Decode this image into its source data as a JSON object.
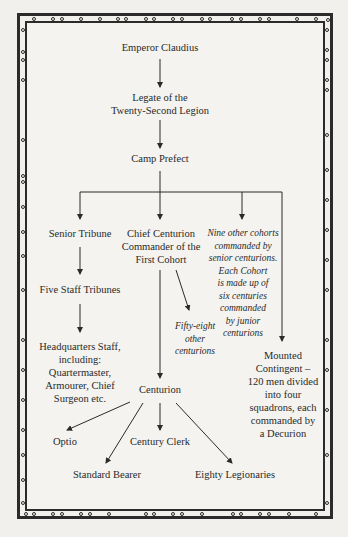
{
  "diagram": {
    "type": "organizational-chart",
    "nodes": {
      "emperor": "Emperor Claudius",
      "legate": "Legate of the\nTwenty-Second Legion",
      "camp_prefect": "Camp Prefect",
      "senior_tribune": "Senior Tribune",
      "chief_centurion": "Chief Centurion\nCommander of the\nFirst Cohort",
      "other_cohorts": "Nine other cohorts\ncommanded by\nsenior centurions.\nEach Cohort\nis made up of\nsix centuries\ncommanded\nby junior\ncenturions",
      "staff_tribunes": "Five Staff Tribunes",
      "fifty_eight": "Fifty-eight\nother\ncenturions",
      "hq_staff": "Headquarters Staff,\nincluding:\nQuartermaster,\nArmourer, Chief\nSurgeon etc.",
      "mounted": "Mounted\nContingent –\n120 men divided\ninto four\nsquadrons, each\ncommanded by\na Decurion",
      "centurion": "Centurion",
      "optio": "Optio",
      "century_clerk": "Century Clerk",
      "standard_bearer": "Standard Bearer",
      "legionaries": "Eighty Legionaries"
    },
    "edges": [
      [
        "emperor",
        "legate"
      ],
      [
        "legate",
        "camp_prefect"
      ],
      [
        "camp_prefect",
        "senior_tribune"
      ],
      [
        "camp_prefect",
        "chief_centurion"
      ],
      [
        "camp_prefect",
        "other_cohorts"
      ],
      [
        "camp_prefect",
        "mounted"
      ],
      [
        "senior_tribune",
        "staff_tribunes"
      ],
      [
        "staff_tribunes",
        "hq_staff"
      ],
      [
        "chief_centurion",
        "fifty_eight"
      ],
      [
        "chief_centurion",
        "centurion"
      ],
      [
        "centurion",
        "optio"
      ],
      [
        "centurion",
        "standard_bearer"
      ],
      [
        "centurion",
        "century_clerk"
      ],
      [
        "centurion",
        "legionaries"
      ]
    ],
    "colors": {
      "ink": "#2a2a2a",
      "paper": "#f4f3ef",
      "frame": "#2b2b2b"
    }
  }
}
